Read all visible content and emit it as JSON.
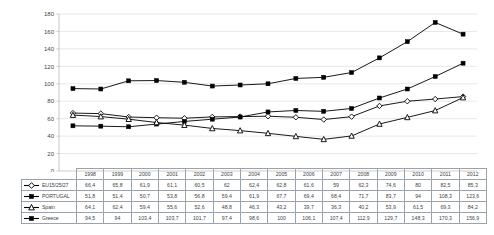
{
  "chart_data": {
    "type": "line",
    "title": "",
    "subtitle": "",
    "xlabel": "",
    "ylabel": "",
    "ylim": [
      0,
      180
    ],
    "ytick_step": 20,
    "yticks": [
      "0",
      "20",
      "40",
      "60",
      "80",
      "100",
      "120",
      "140",
      "160",
      "180"
    ],
    "grid": true,
    "grid_color": "#d9d9d9",
    "legend_position": "data-table",
    "categories": [
      "1998",
      "1999",
      "2000",
      "2001",
      "2002",
      "2003",
      "2004",
      "2005",
      "2006",
      "2007",
      "2008",
      "2009",
      "2010",
      "2011",
      "2012"
    ],
    "series": [
      {
        "name": "EU15/25/27",
        "marker": "open-diamond",
        "color": "#000000",
        "values": [
          66.4,
          65.8,
          61.9,
          61.1,
          60.5,
          62,
          62.4,
          62.8,
          61.6,
          59,
          62.3,
          74.6,
          80,
          82.5,
          85.3
        ],
        "labels": [
          "66,4",
          "65,8",
          "61,9",
          "61,1",
          "60,5",
          "62",
          "62,4",
          "62,8",
          "61,6",
          "59",
          "62,3",
          "74,6",
          "80",
          "82,5",
          "85,3"
        ]
      },
      {
        "name": "PORTUGAL",
        "marker": "filled-square",
        "color": "#000000",
        "values": [
          51.8,
          51.4,
          50.7,
          53.8,
          56.8,
          59.4,
          61.9,
          67.7,
          69.4,
          68.4,
          71.7,
          83.7,
          94,
          108.3,
          123.6
        ],
        "labels": [
          "51,8",
          "51,4",
          "50,7",
          "53,8",
          "56,8",
          "59,4",
          "61,9",
          "67,7",
          "69,4",
          "68,4",
          "71,7",
          "83,7",
          "94",
          "108,3",
          "123,6"
        ]
      },
      {
        "name": "Spain",
        "marker": "open-triangle",
        "color": "#000000",
        "values": [
          64.1,
          62.4,
          59.4,
          55.6,
          52.6,
          48.8,
          46.3,
          43.2,
          39.7,
          36.3,
          40.2,
          53.9,
          61.5,
          69.3,
          84.2
        ],
        "labels": [
          "64,1",
          "62,4",
          "59,4",
          "55,6",
          "52,6",
          "48,8",
          "46,3",
          "43,2",
          "39,7",
          "36,3",
          "40,2",
          "53,9",
          "61,5",
          "69,3",
          "84,2"
        ]
      },
      {
        "name": "Greece",
        "marker": "filled-square",
        "color": "#000000",
        "values": [
          94.5,
          94,
          103.4,
          103.7,
          101.7,
          97.4,
          98.6,
          100,
          106.1,
          107.4,
          112.9,
          129.7,
          148.3,
          170.3,
          156.9
        ],
        "labels": [
          "94,5",
          "94",
          "103,4",
          "103,7",
          "101,7",
          "97,4",
          "98,6",
          "100",
          "106,1",
          "107,4",
          "112,9",
          "129,7",
          "148,3",
          "170,3",
          "156,9"
        ]
      }
    ]
  },
  "table": {
    "corner_label": "",
    "column_headers": [
      "1998",
      "1999",
      "2000",
      "2001",
      "2002",
      "2003",
      "2004",
      "2005",
      "2006",
      "2007",
      "2008",
      "2009",
      "2010",
      "2011",
      "2012"
    ],
    "rows": [
      {
        "label": "EU15/25/27",
        "marker": "open-diamond",
        "values": [
          "66,4",
          "65,8",
          "61,9",
          "61,1",
          "60,5",
          "62",
          "62,4",
          "62,8",
          "61,6",
          "59",
          "62,3",
          "74,6",
          "80",
          "82,5",
          "85,3"
        ]
      },
      {
        "label": "PORTUGAL",
        "marker": "filled-square",
        "values": [
          "51,8",
          "51,4",
          "50,7",
          "53,8",
          "56,8",
          "59,4",
          "61,9",
          "67,7",
          "69,4",
          "68,4",
          "71,7",
          "83,7",
          "94",
          "108,3",
          "123,6"
        ]
      },
      {
        "label": "Spain",
        "marker": "open-triangle",
        "values": [
          "64,1",
          "62,4",
          "59,4",
          "55,6",
          "52,6",
          "48,8",
          "46,3",
          "43,2",
          "39,7",
          "36,3",
          "40,2",
          "53,9",
          "61,5",
          "69,3",
          "84,2"
        ]
      },
      {
        "label": "Greece",
        "marker": "filled-square",
        "values": [
          "94,5",
          "94",
          "103,4",
          "103,7",
          "101,7",
          "97,4",
          "98,6",
          "100",
          "106,1",
          "107,4",
          "112,9",
          "129,7",
          "148,3",
          "170,3",
          "156,9"
        ]
      }
    ]
  },
  "style": {
    "line_color": "#000000",
    "grid_color": "#d9d9d9",
    "axis_color": "#b7b7b7",
    "table_border_color": "#9aa3ad",
    "text_color": "#3f3f3f",
    "background": "#ffffff"
  }
}
